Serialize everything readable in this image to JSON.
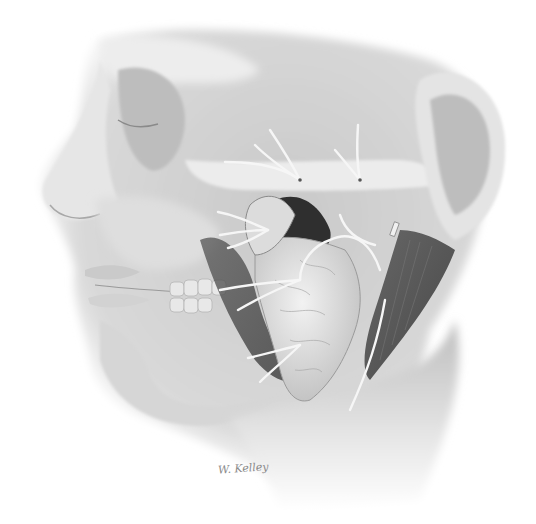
{
  "illustration": {
    "subject": "Lateral view of face with facial nerve and parotid gland dissection",
    "style": "grayscale pencil medical illustration",
    "background": "#ffffff",
    "colors": {
      "skin_light": "#e9e9e9",
      "skin_mid": "#cfcfcf",
      "shadow": "#9a9a9a",
      "deep": "#3a3a3a",
      "nerve": "#f4f4f4",
      "gland": "#dedede"
    },
    "signature": "W. Kelley"
  }
}
